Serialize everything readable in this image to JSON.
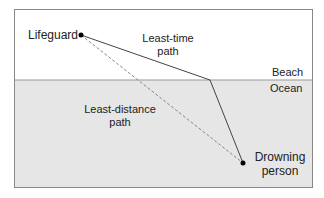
{
  "diagram": {
    "labels": {
      "lifeguard": "Lifeguard",
      "least_time_1": "Least-time",
      "least_time_2": "path",
      "beach": "Beach",
      "ocean": "Ocean",
      "least_distance_1": "Least-distance",
      "least_distance_2": "path",
      "drowning_1": "Drowning",
      "drowning_2": "person"
    },
    "colors": {
      "beach": "#ffffff",
      "ocean": "#e6e6e6",
      "frame": "#888888",
      "path": "#444444",
      "dashed": "#888888"
    }
  }
}
